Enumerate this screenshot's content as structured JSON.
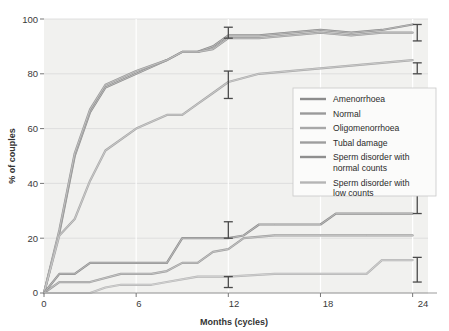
{
  "chart_data": {
    "type": "line",
    "title": "",
    "subtitle": "",
    "xlabel": "Months (cycles)",
    "ylabel": "% of couples",
    "xlim": [
      0,
      25
    ],
    "ylim": [
      0,
      100
    ],
    "xticks": [
      "0",
      "6",
      "12",
      "18",
      "24"
    ],
    "xtick_values": [
      0,
      6,
      12,
      18,
      24
    ],
    "yticks": [
      "0",
      "20",
      "40",
      "60",
      "80",
      "100"
    ],
    "ytick_values": [
      0,
      20,
      40,
      60,
      80,
      100
    ],
    "grid": true,
    "legend_position": "center-right",
    "series": [
      {
        "name": "Amenorrhoea",
        "color": "#8c8c8c",
        "x": [
          0,
          1,
          2,
          3,
          4,
          6,
          8,
          9,
          10,
          11,
          12,
          14,
          16,
          18,
          20,
          22,
          24
        ],
        "values": [
          0,
          22,
          50,
          66,
          75,
          80,
          85,
          88,
          88,
          90,
          94,
          94,
          95,
          96,
          95,
          96,
          98
        ]
      },
      {
        "name": "Normal",
        "color": "#9a9a9a",
        "x": [
          0,
          1,
          2,
          3,
          4,
          6,
          8,
          9,
          10,
          11,
          12,
          14,
          16,
          18,
          20,
          22,
          24
        ],
        "values": [
          0,
          23,
          51,
          67,
          76,
          81,
          85,
          88,
          88,
          89,
          93,
          93,
          94,
          95,
          94,
          95,
          95
        ]
      },
      {
        "name": "Oligomenorrhoea",
        "color": "#a8a8a8",
        "x": [
          0,
          1,
          2,
          3,
          4,
          6,
          8,
          9,
          10,
          11,
          12,
          14,
          16,
          18,
          20,
          22,
          24
        ],
        "values": [
          0,
          21,
          27,
          41,
          52,
          60,
          65,
          65,
          69,
          73,
          77,
          80,
          81,
          82,
          83,
          84,
          85
        ]
      },
      {
        "name": "Tubal damage",
        "color": "#9e9e9e",
        "x": [
          0,
          1,
          3,
          5,
          7,
          8,
          9,
          10,
          11,
          12,
          13,
          15,
          18,
          21,
          24
        ],
        "values": [
          0,
          4,
          4,
          7,
          7,
          8,
          11,
          11,
          15,
          16,
          20,
          21,
          21,
          21,
          21
        ]
      },
      {
        "name": "Sperm disorder with normal counts",
        "color": "#8f8f8f",
        "x": [
          0,
          1,
          2,
          3,
          6,
          8,
          9,
          11,
          12,
          13,
          14,
          15,
          18,
          19,
          22,
          24
        ],
        "values": [
          0,
          7,
          7,
          11,
          11,
          11,
          20,
          20,
          20,
          21,
          25,
          25,
          25,
          29,
          29,
          29
        ]
      },
      {
        "name": "Sperm disorder with low counts",
        "color": "#b5b5b5",
        "x": [
          0,
          3,
          4,
          5,
          7,
          8,
          10,
          12,
          15,
          18,
          21,
          22,
          24
        ],
        "values": [
          0,
          0,
          2,
          3,
          3,
          4,
          6,
          6,
          7,
          7,
          7,
          12,
          12
        ]
      }
    ],
    "error_bars": [
      {
        "series": "Amenorrhoea",
        "x": 12,
        "y": 94,
        "lower": 93,
        "upper": 97
      },
      {
        "series": "Oligomenorrhoea",
        "x": 12,
        "y": 76,
        "lower": 71,
        "upper": 81
      },
      {
        "series": "Sperm disorder with normal counts",
        "x": 12,
        "y": 21,
        "lower": 20,
        "upper": 26
      },
      {
        "series": "Sperm disorder with low counts",
        "x": 12,
        "y": 4,
        "lower": 2,
        "upper": 6
      },
      {
        "series": "Amenorrhoea",
        "x": 24.3,
        "y": 95,
        "lower": 92,
        "upper": 98
      },
      {
        "series": "Oligomenorrhoea",
        "x": 24.3,
        "y": 82,
        "lower": 80,
        "upper": 84
      },
      {
        "series": "Sperm disorder with normal counts",
        "x": 24.3,
        "y": 31,
        "lower": 29,
        "upper": 37
      },
      {
        "series": "Sperm disorder with low counts",
        "x": 24.3,
        "y": 9,
        "lower": 4,
        "upper": 13
      }
    ]
  },
  "legend": {
    "items": [
      {
        "label": "Amenorrhoea"
      },
      {
        "label": "Normal"
      },
      {
        "label": "Oligomenorrhoea"
      },
      {
        "label": "Tubal damage"
      },
      {
        "label": "Sperm disorder with",
        "label2": "normal counts"
      },
      {
        "label": "Sperm disorder with",
        "label2": "low counts"
      }
    ]
  },
  "axes": {
    "y_title": "% of couples",
    "x_title": "Months (cycles)",
    "y_tick_0": "0",
    "y_tick_20": "20",
    "y_tick_40": "40",
    "y_tick_60": "60",
    "y_tick_80": "80",
    "y_tick_100": "100",
    "x_tick_0": "0",
    "x_tick_6": "6",
    "x_tick_12": "12",
    "x_tick_18": "18",
    "x_tick_24": "24"
  },
  "colors": {
    "plot_background": "#f1f1ef",
    "page_background": "#ffffff",
    "grid": "#d9d9d9",
    "axis": "#9b9b9b",
    "text": "#333333",
    "legend_background": "#fbfbfa",
    "legend_border": "#c9c9c9",
    "error_bar": "#4a4a4a"
  }
}
